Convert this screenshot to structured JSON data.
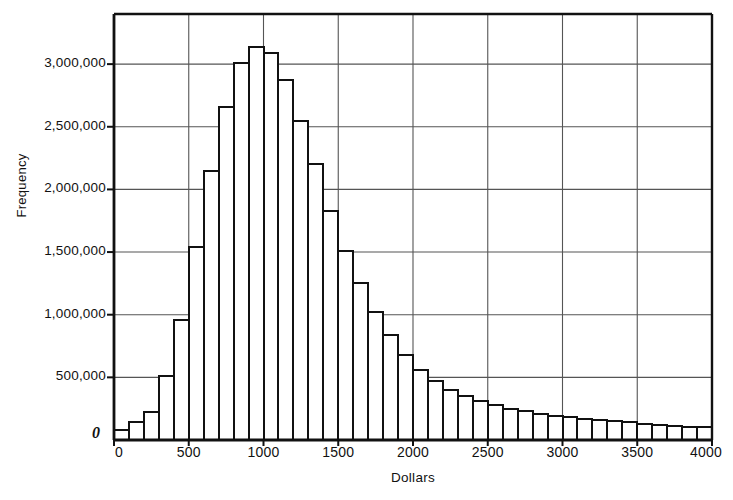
{
  "chart_data": {
    "type": "bar",
    "title": "",
    "subtitle": "",
    "xlabel": "Dollars",
    "ylabel": "Frequency",
    "annotation": "Class Interval=$100",
    "grid": true,
    "legend": null,
    "xlim": [
      0,
      4000
    ],
    "ylim": [
      0,
      3400000
    ],
    "xticks": [
      "0",
      "500",
      "1000",
      "1500",
      "2000",
      "2500",
      "3000",
      "3500",
      "4000"
    ],
    "xtick_values": [
      0,
      500,
      1000,
      1500,
      2000,
      2500,
      3000,
      3500,
      4000
    ],
    "yticks": [
      "0",
      "500,000",
      "1,000,000",
      "1,500,000",
      "2,000,000",
      "2,500,000",
      "3,000,000"
    ],
    "ytick_values": [
      0,
      500000,
      1000000,
      1500000,
      2000000,
      2500000,
      3000000
    ],
    "zero_label": "0",
    "bin_width": 100,
    "bin_starts": [
      0,
      100,
      200,
      300,
      400,
      500,
      600,
      700,
      800,
      900,
      1000,
      1100,
      1200,
      1300,
      1400,
      1500,
      1600,
      1700,
      1800,
      1900,
      2000,
      2100,
      2200,
      2300,
      2400,
      2500,
      2600,
      2700,
      2800,
      2900,
      3000,
      3100,
      3200,
      3300,
      3400,
      3500,
      3600,
      3700,
      3800,
      3900
    ],
    "categories": [
      "0-100",
      "100-200",
      "200-300",
      "300-400",
      "400-500",
      "500-600",
      "600-700",
      "700-800",
      "800-900",
      "900-1000",
      "1000-1100",
      "1100-1200",
      "1200-1300",
      "1300-1400",
      "1400-1500",
      "1500-1600",
      "1600-1700",
      "1700-1800",
      "1800-1900",
      "1900-2000",
      "2000-2100",
      "2100-2200",
      "2200-2300",
      "2300-2400",
      "2400-2500",
      "2500-2600",
      "2600-2700",
      "2700-2800",
      "2800-2900",
      "2900-3000",
      "3000-3100",
      "3100-3200",
      "3200-3300",
      "3300-3400",
      "3400-3500",
      "3500-3600",
      "3600-3700",
      "3700-3800",
      "3800-3900",
      "3900-4000"
    ],
    "values": [
      80000,
      140000,
      220000,
      510000,
      960000,
      1540000,
      2150000,
      2660000,
      3010000,
      3140000,
      3090000,
      2870000,
      2550000,
      2200000,
      1830000,
      1510000,
      1250000,
      1020000,
      840000,
      680000,
      560000,
      470000,
      400000,
      350000,
      310000,
      280000,
      250000,
      230000,
      210000,
      195000,
      180000,
      170000,
      160000,
      150000,
      140000,
      130000,
      120000,
      115000,
      105000,
      100000
    ],
    "bar_fill": "#ffffff",
    "bar_edge": "#111111",
    "grid_color": "#555555",
    "axis_color": "#111111",
    "background": "#ffffff"
  }
}
